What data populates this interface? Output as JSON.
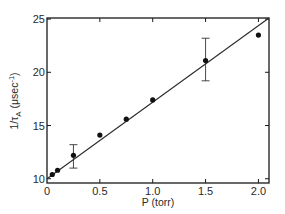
{
  "chart_data": {
    "type": "scatter",
    "title": "",
    "xlabel": "P (torr)",
    "ylabel": "1/τA (μsec⁻¹)",
    "ylabel_parts": {
      "main": "1/τ",
      "sub": "A",
      "unit": " (μsec",
      "sup": "-1",
      "close": ")"
    },
    "xlim": [
      0,
      2.1
    ],
    "ylim": [
      9.6,
      25.1
    ],
    "x_ticks": [
      0,
      0.5,
      1.0,
      1.5,
      2.0
    ],
    "x_tick_labels": [
      "0",
      "0.5",
      "1.0",
      "1.5",
      "2.0"
    ],
    "y_ticks": [
      10,
      15,
      20,
      25
    ],
    "y_tick_labels": [
      "10",
      "15",
      "20",
      "25"
    ],
    "grid": false,
    "legend": null,
    "series": [
      {
        "name": "measured",
        "marker": "filled-circle",
        "x": [
          0.05,
          0.1,
          0.25,
          0.5,
          0.75,
          1.0,
          1.5,
          2.0
        ],
        "y": [
          10.4,
          10.8,
          12.2,
          14.1,
          15.6,
          17.4,
          21.1,
          23.5
        ],
        "error_bars": [
          {
            "x": 0.25,
            "low": 11.0,
            "high": 13.2
          },
          {
            "x": 1.5,
            "low": 19.2,
            "high": 23.2
          }
        ]
      },
      {
        "name": "linear fit",
        "type": "line",
        "x": [
          0,
          2.1
        ],
        "y": [
          10.0,
          25.3
        ]
      }
    ]
  }
}
